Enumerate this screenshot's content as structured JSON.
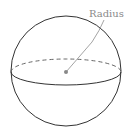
{
  "diagram": {
    "label": "Radius",
    "colors": {
      "outline": "#333333",
      "leader": "#9a9a9a",
      "center_dot": "#888888",
      "label": "#8a8a8a",
      "background": "#ffffff"
    },
    "elements": [
      {
        "type": "circle",
        "name": "sphere-outline",
        "cx": 66,
        "cy": 71,
        "r": 55
      },
      {
        "type": "ellipse-back",
        "name": "equator-back-dashed",
        "cx": 66,
        "cy": 72,
        "rx": 55,
        "ry": 13,
        "style": "dashed"
      },
      {
        "type": "ellipse-front",
        "name": "equator-front-solid",
        "cx": 66,
        "cy": 72,
        "rx": 55,
        "ry": 13,
        "style": "solid"
      },
      {
        "type": "dot",
        "name": "center-point",
        "cx": 66,
        "cy": 72
      },
      {
        "type": "line",
        "name": "radius-leader",
        "from": [
          66,
          72
        ],
        "to": [
          104,
          20
        ]
      }
    ]
  }
}
